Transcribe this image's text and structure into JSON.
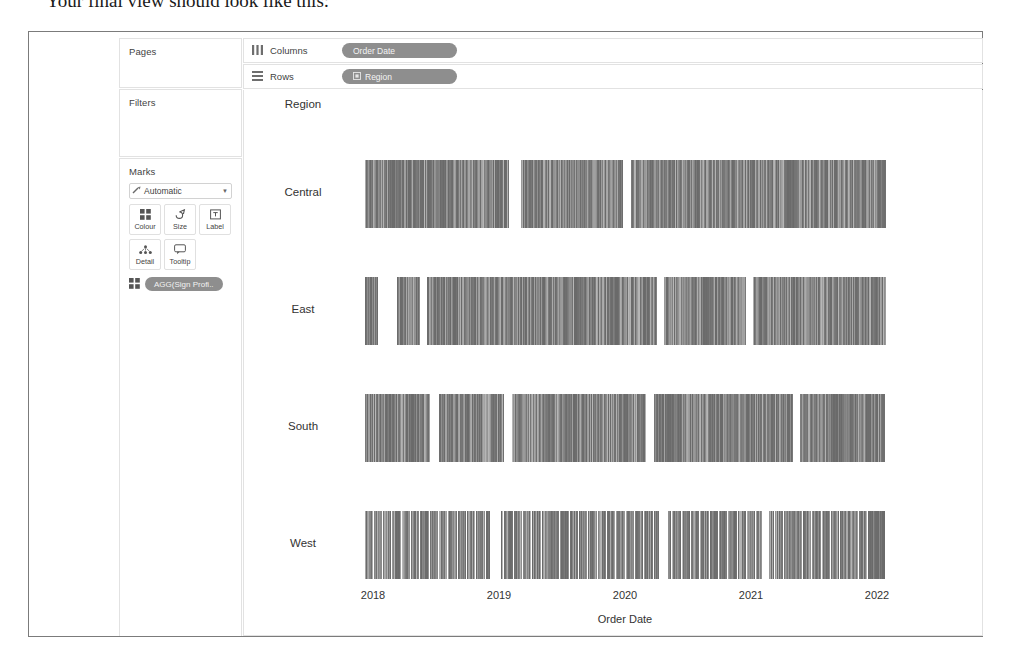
{
  "caption": "Your final view should look like this:",
  "shelves": {
    "columns": {
      "label": "Columns",
      "icon": "columns-icon",
      "pill": "Order Date"
    },
    "rows": {
      "label": "Rows",
      "icon": "rows-icon",
      "pill": "Region",
      "pill_icon": "dimension-icon"
    }
  },
  "sidebar": {
    "pages": {
      "title": "Pages"
    },
    "filters": {
      "title": "Filters"
    },
    "marks": {
      "title": "Marks",
      "mark_type": "Automatic",
      "mark_type_icon": "automatic-mark-icon",
      "dropdown_icon": "chevron-down-icon",
      "buttons": [
        {
          "label": "Colour",
          "icon": "colour-icon"
        },
        {
          "label": "Size",
          "icon": "size-icon"
        },
        {
          "label": "Label",
          "icon": "label-icon"
        },
        {
          "label": "Detail",
          "icon": "detail-icon"
        },
        {
          "label": "Tooltip",
          "icon": "tooltip-icon"
        }
      ],
      "pill": {
        "text": "AGG(Sign Profi..",
        "icon": "colour-icon"
      }
    }
  },
  "view": {
    "row_header_title": "Region",
    "rows": [
      "Central",
      "East",
      "South",
      "West"
    ],
    "axis_title": "Order Date",
    "ticks": [
      "2018",
      "2019",
      "2020",
      "2021",
      "2022"
    ]
  },
  "colors": {
    "pill_bg": "#8e8e8e",
    "panel_border": "#e2e2e2",
    "frame_border": "#7b7b7b",
    "mark_light": "#b8b8b8",
    "mark_dark": "#6a6a6a"
  },
  "chart_data": {
    "type": "bar",
    "title": "",
    "xlabel": "Order Date",
    "ylabel": "Region",
    "grid": false,
    "legend": "none",
    "x_tick_labels": [
      "2018",
      "2019",
      "2020",
      "2021",
      "2022"
    ],
    "x_range": [
      "2018",
      "2022"
    ],
    "categories": [
      "Central",
      "East",
      "South",
      "West"
    ],
    "series": [
      {
        "name": "Central",
        "fill_start_pct": 0.5,
        "fill_end_pct": 99.5,
        "density": 0.86,
        "gaps_pct": [
          [
            28.0,
            30.2
          ],
          [
            49.5,
            51.2
          ]
        ]
      },
      {
        "name": "East",
        "fill_start_pct": 0.5,
        "fill_end_pct": 99.5,
        "density": 0.83,
        "gaps_pct": [
          [
            3.0,
            6.5
          ],
          [
            11.0,
            12.2
          ],
          [
            56.0,
            57.4
          ],
          [
            73.0,
            74.4
          ]
        ]
      },
      {
        "name": "South",
        "fill_start_pct": 0.5,
        "fill_end_pct": 99.5,
        "density": 0.74,
        "gaps_pct": [
          [
            13.0,
            14.6
          ],
          [
            27.0,
            28.4
          ],
          [
            54.0,
            55.4
          ],
          [
            82.0,
            83.2
          ]
        ]
      },
      {
        "name": "West",
        "fill_start_pct": 0.5,
        "fill_end_pct": 99.5,
        "density": 0.62,
        "gaps_pct": [
          [
            24.5,
            26.4
          ],
          [
            56.5,
            58.0
          ],
          [
            76.0,
            77.2
          ]
        ]
      }
    ]
  }
}
